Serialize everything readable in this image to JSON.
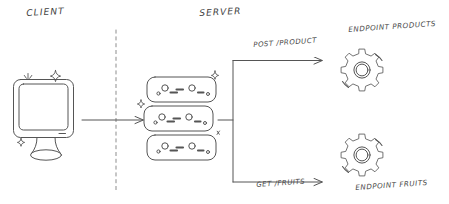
{
  "diagram": {
    "title_client": "CLIENT",
    "title_server": "SERVER",
    "divider": "dashed-vertical-divider",
    "client_node": {
      "icon": "monitor-icon",
      "sparkles": 3
    },
    "server_node": {
      "icon": "server-stack-icon",
      "units": 3,
      "sparkles": 2
    },
    "flows": [
      {
        "id": "client-to-server",
        "label": "",
        "arrow": "arrow-right"
      },
      {
        "id": "post-product",
        "label": "POST /PRODUCT",
        "arrow": "arrow-right",
        "target": "ENDPOINT PRODUCTS"
      },
      {
        "id": "get-fruits",
        "label": "GET /FRUITS",
        "arrow": "arrow-right",
        "target": "ENDPOINT FRUITS"
      }
    ],
    "endpoints": [
      {
        "id": "endpoint-products",
        "label": "ENDPOINT PRODUCTS",
        "icon": "gear-icon"
      },
      {
        "id": "endpoint-fruits",
        "label": "ENDPOINT FRUITS",
        "icon": "gear-icon"
      }
    ],
    "colors": {
      "stroke": "#555555",
      "text": "#4a4a4a",
      "background": "#ffffff"
    }
  }
}
